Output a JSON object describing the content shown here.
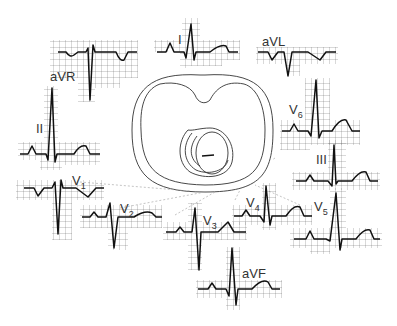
{
  "leads": {
    "I": {
      "label": "I"
    },
    "aVR": {
      "label": "aVR"
    },
    "aVL": {
      "label": "aVL"
    },
    "II": {
      "label": "II"
    },
    "III": {
      "label": "III"
    },
    "aVF": {
      "label": "aVF"
    },
    "V1": {
      "label": "V",
      "sub": "1"
    },
    "V2": {
      "label": "V",
      "sub": "2"
    },
    "V3": {
      "label": "V",
      "sub": "3"
    },
    "V4": {
      "label": "V",
      "sub": "4"
    },
    "V5": {
      "label": "V",
      "sub": "5"
    },
    "V6": {
      "label": "V",
      "sub": "6"
    }
  },
  "colors": {
    "trace": "#111111",
    "grid": "#555555",
    "outline": "#333333",
    "dashed_leader": "#aaaaaa"
  }
}
